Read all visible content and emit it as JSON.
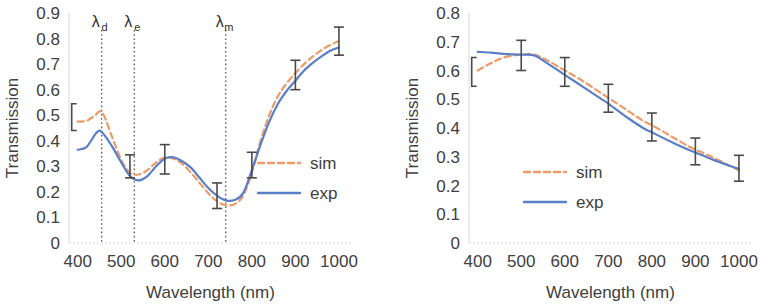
{
  "figure": {
    "panel_count": 2,
    "colors": {
      "sim": "#ED9B68",
      "exp": "#5B7FC7",
      "errorbar": "#4a4a4a",
      "guide": "#585858",
      "axis": "#d9d9d9",
      "text": "#404040",
      "background": "#ffffff"
    }
  },
  "chart_data": [
    {
      "panel": "left",
      "type": "line",
      "title": "",
      "xlabel": "Wavelength (nm)",
      "ylabel": "Transmission",
      "xlim": [
        380,
        1030
      ],
      "ylim": [
        0,
        0.9
      ],
      "xticks": [
        400,
        500,
        600,
        700,
        800,
        900,
        1000
      ],
      "xtick_labels": [
        "400",
        "500",
        "600",
        "700",
        "800",
        "900",
        "1000"
      ],
      "yticks": [
        0,
        0.1,
        0.2,
        0.3,
        0.4,
        0.5,
        0.6,
        0.7,
        0.8,
        0.9
      ],
      "ytick_labels": [
        "0",
        "0.1",
        "0.2",
        "0.3",
        "0.4",
        "0.5",
        "0.6",
        "0.7",
        "0.8",
        "0.9"
      ],
      "grid": false,
      "legend": {
        "position": "center-right",
        "entries": [
          {
            "name": "sim",
            "style": "dashed",
            "color": "#ED9B68"
          },
          {
            "name": "exp",
            "style": "solid",
            "color": "#5B7FC7"
          }
        ]
      },
      "series": [
        {
          "name": "sim",
          "style": "dashed",
          "color": "#ED9B68",
          "x": [
            400,
            420,
            440,
            450,
            460,
            480,
            500,
            520,
            540,
            560,
            580,
            600,
            620,
            640,
            660,
            680,
            700,
            720,
            740,
            760,
            780,
            800,
            820,
            840,
            860,
            880,
            900,
            920,
            940,
            960,
            980,
            1000
          ],
          "y": [
            0.475,
            0.478,
            0.5,
            0.515,
            0.5,
            0.41,
            0.325,
            0.275,
            0.268,
            0.285,
            0.315,
            0.335,
            0.33,
            0.31,
            0.275,
            0.235,
            0.195,
            0.163,
            0.148,
            0.152,
            0.185,
            0.275,
            0.4,
            0.5,
            0.575,
            0.625,
            0.665,
            0.7,
            0.73,
            0.755,
            0.775,
            0.79
          ]
        },
        {
          "name": "exp",
          "style": "solid",
          "color": "#5B7FC7",
          "x": [
            400,
            420,
            440,
            450,
            460,
            480,
            500,
            520,
            540,
            560,
            580,
            600,
            620,
            640,
            660,
            680,
            700,
            720,
            740,
            760,
            780,
            800,
            820,
            840,
            860,
            880,
            900,
            920,
            940,
            960,
            980,
            1000
          ],
          "y": [
            0.365,
            0.375,
            0.425,
            0.44,
            0.425,
            0.375,
            0.315,
            0.262,
            0.245,
            0.262,
            0.3,
            0.33,
            0.335,
            0.32,
            0.295,
            0.255,
            0.215,
            0.185,
            0.167,
            0.168,
            0.195,
            0.285,
            0.385,
            0.475,
            0.545,
            0.595,
            0.635,
            0.675,
            0.705,
            0.73,
            0.752,
            0.765
          ]
        }
      ],
      "error_bars": [
        {
          "x": 400,
          "y": 0.475,
          "lower": 0.44,
          "upper": 0.545,
          "style": "bracket"
        },
        {
          "x": 520,
          "y": 0.3,
          "lower": 0.255,
          "upper": 0.345,
          "style": "capped"
        },
        {
          "x": 600,
          "y": 0.325,
          "lower": 0.27,
          "upper": 0.385,
          "style": "capped"
        },
        {
          "x": 720,
          "y": 0.185,
          "lower": 0.135,
          "upper": 0.235,
          "style": "capped"
        },
        {
          "x": 800,
          "y": 0.305,
          "lower": 0.255,
          "upper": 0.355,
          "style": "capped"
        },
        {
          "x": 900,
          "y": 0.655,
          "lower": 0.6,
          "upper": 0.715,
          "style": "capped"
        },
        {
          "x": 1000,
          "y": 0.78,
          "lower": 0.735,
          "upper": 0.845,
          "style": "capped"
        }
      ],
      "annotations": [
        {
          "id": "lambda-d",
          "base": "λ",
          "sub": "d",
          "x": 455,
          "vline": true
        },
        {
          "id": "lambda-e",
          "base": "λ",
          "sub": "e",
          "x": 530,
          "vline": true
        },
        {
          "id": "lambda-m",
          "base": "λ",
          "sub": "m",
          "x": 740,
          "vline": true
        }
      ]
    },
    {
      "panel": "right",
      "type": "line",
      "title": "",
      "xlabel": "Wavelength (nm)",
      "ylabel": "Transmission",
      "xlim": [
        380,
        1030
      ],
      "ylim": [
        0,
        0.8
      ],
      "xticks": [
        400,
        500,
        600,
        700,
        800,
        900,
        1000
      ],
      "xtick_labels": [
        "400",
        "500",
        "600",
        "700",
        "800",
        "900",
        "1000"
      ],
      "yticks": [
        0,
        0.1,
        0.2,
        0.3,
        0.4,
        0.5,
        0.6,
        0.7,
        0.8
      ],
      "ytick_labels": [
        "0",
        "0.1",
        "0.2",
        "0.3",
        "0.4",
        "0.5",
        "0.6",
        "0.7",
        "0.8"
      ],
      "grid": false,
      "legend": {
        "position": "center-left",
        "entries": [
          {
            "name": "sim",
            "style": "dashed",
            "color": "#ED9B68"
          },
          {
            "name": "exp",
            "style": "solid",
            "color": "#5B7FC7"
          }
        ]
      },
      "series": [
        {
          "name": "sim",
          "style": "dashed",
          "color": "#ED9B68",
          "x": [
            400,
            430,
            460,
            500,
            530,
            560,
            600,
            640,
            680,
            700,
            740,
            780,
            800,
            840,
            880,
            900,
            940,
            980,
            1000
          ],
          "y": [
            0.6,
            0.625,
            0.645,
            0.655,
            0.655,
            0.635,
            0.6,
            0.565,
            0.525,
            0.505,
            0.465,
            0.425,
            0.41,
            0.375,
            0.34,
            0.325,
            0.298,
            0.268,
            0.252
          ]
        },
        {
          "name": "exp",
          "style": "solid",
          "color": "#5B7FC7",
          "x": [
            400,
            430,
            460,
            500,
            530,
            560,
            600,
            640,
            680,
            700,
            740,
            780,
            800,
            840,
            880,
            900,
            940,
            980,
            1000
          ],
          "y": [
            0.665,
            0.662,
            0.658,
            0.655,
            0.652,
            0.625,
            0.585,
            0.545,
            0.505,
            0.485,
            0.44,
            0.4,
            0.385,
            0.355,
            0.327,
            0.315,
            0.29,
            0.268,
            0.258
          ]
        }
      ],
      "error_bars": [
        {
          "x": 400,
          "y": 0.6,
          "lower": 0.545,
          "upper": 0.645,
          "style": "bracket"
        },
        {
          "x": 500,
          "y": 0.655,
          "lower": 0.6,
          "upper": 0.705,
          "style": "capped"
        },
        {
          "x": 600,
          "y": 0.59,
          "lower": 0.545,
          "upper": 0.645,
          "style": "capped"
        },
        {
          "x": 700,
          "y": 0.5,
          "lower": 0.455,
          "upper": 0.552,
          "style": "capped"
        },
        {
          "x": 800,
          "y": 0.405,
          "lower": 0.355,
          "upper": 0.452,
          "style": "capped"
        },
        {
          "x": 900,
          "y": 0.318,
          "lower": 0.272,
          "upper": 0.365,
          "style": "capped"
        },
        {
          "x": 1000,
          "y": 0.258,
          "lower": 0.215,
          "upper": 0.305,
          "style": "capped"
        }
      ],
      "annotations": []
    }
  ]
}
